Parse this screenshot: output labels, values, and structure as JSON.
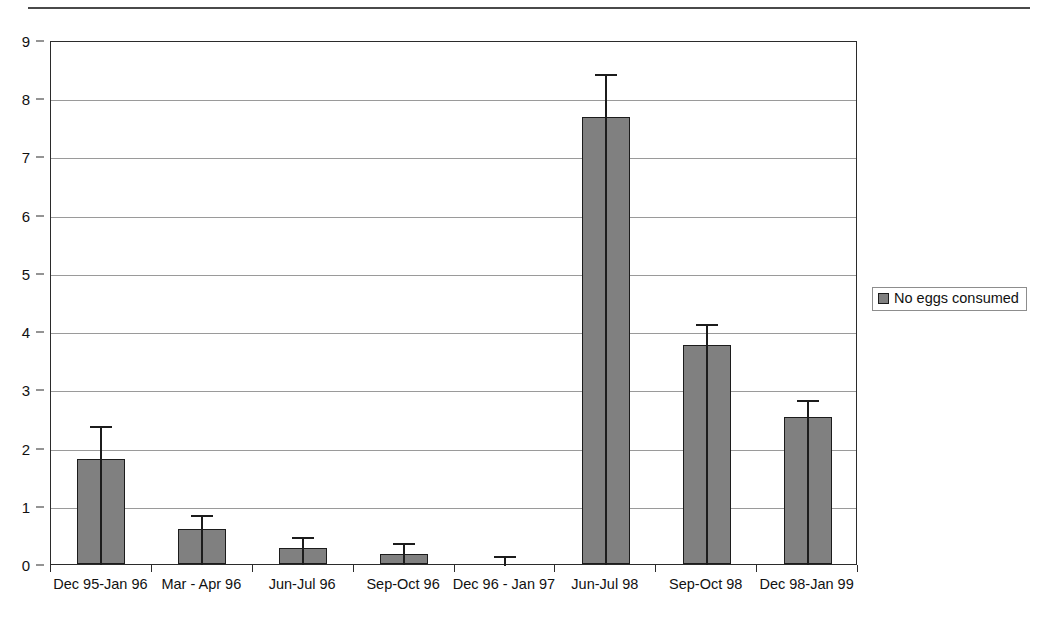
{
  "page": {
    "top_rule": "horizontal-rule"
  },
  "legend": {
    "position": "right",
    "swatch_name": "series-color-swatch",
    "swatch_color": "#808080",
    "label": "No eggs consumed"
  },
  "chart_data": {
    "type": "bar",
    "title": "",
    "xlabel": "",
    "ylabel": "",
    "ylim": [
      0,
      9
    ],
    "yticks": [
      0,
      1,
      2,
      3,
      4,
      5,
      6,
      7,
      8,
      9
    ],
    "grid": true,
    "legend_position": "right",
    "categories": [
      "Dec 95-Jan 96",
      "Mar - Apr 96",
      "Jun-Jul 96",
      "Sep-Oct 96",
      "Dec 96 - Jan 97",
      "Jun-Jul 98",
      "Sep-Oct 98",
      "Dec 98-Jan 99"
    ],
    "series": [
      {
        "name": "No eggs consumed",
        "color": "#808080",
        "values": [
          1.8,
          0.6,
          0.28,
          0.18,
          0.0,
          7.67,
          3.77,
          2.52
        ],
        "errors_upper": [
          2.4,
          0.87,
          0.5,
          0.4,
          0.18,
          8.45,
          4.15,
          2.85
        ]
      }
    ]
  }
}
